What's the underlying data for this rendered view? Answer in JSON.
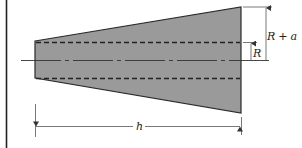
{
  "diagram": {
    "type": "tapered-bar-cross-section",
    "colors": {
      "fill": "#9a9a9a",
      "line": "#2a2a2a",
      "dim_line": "#555555",
      "background": "#ffffff"
    },
    "labels": {
      "outer_radius_var": "R",
      "outer_radius_op": "+",
      "outer_radius_inc": "a",
      "inner_radius": "R",
      "length": "h"
    },
    "shape": {
      "left_x": 35,
      "right_x": 241,
      "centerline_y": 60,
      "left_top_y": 41,
      "left_bottom_y": 78,
      "right_top_y": 7,
      "right_bottom_y": 113,
      "bore_top_y": 42,
      "bore_bottom_y": 78
    },
    "dimensions": [
      {
        "name": "outer-radius",
        "label_ref": "R + a",
        "from_y": 7,
        "to_y": 60,
        "x": 266
      },
      {
        "name": "inner-radius",
        "label_ref": "R",
        "from_y": 42,
        "to_y": 60,
        "x": 251
      },
      {
        "name": "length",
        "label_ref": "h",
        "from_x": 35,
        "to_x": 241,
        "y": 126
      }
    ]
  }
}
